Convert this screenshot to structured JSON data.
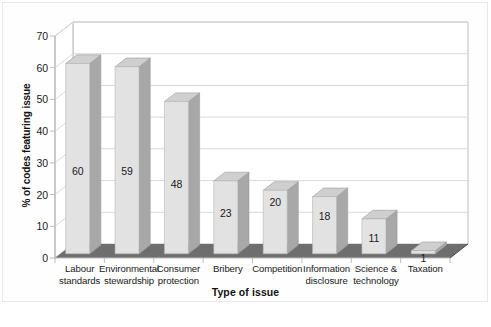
{
  "chart_data": {
    "type": "bar",
    "title": "",
    "subtitle": "",
    "xlabel": "Type of issue",
    "ylabel": "% of codes featuring issue",
    "categories": [
      "Labour standards",
      "Environmental stewardship",
      "Consumer protection",
      "Bribery",
      "Competition",
      "Information disclosure",
      "Science & technology",
      "Taxation"
    ],
    "category_lines": [
      [
        "Labour",
        "standards"
      ],
      [
        "Environmental",
        "stewardship"
      ],
      [
        "Consumer",
        "protection"
      ],
      [
        "Bribery",
        ""
      ],
      [
        "Competition",
        ""
      ],
      [
        "Information",
        "disclosure"
      ],
      [
        "Science &",
        "technology"
      ],
      [
        "Taxation",
        ""
      ]
    ],
    "values": [
      60,
      59,
      48,
      23,
      20,
      18,
      11,
      1
    ],
    "value_labels": [
      "60",
      "59",
      "48",
      "23",
      "20",
      "18",
      "11",
      "1"
    ],
    "ylim": [
      0,
      70
    ],
    "ytick_labels": [
      "0",
      "10",
      "20",
      "30",
      "40",
      "50",
      "60",
      "70"
    ],
    "ytick_values": [
      0,
      10,
      20,
      30,
      40,
      50,
      60,
      70
    ],
    "grid": true,
    "grid_axis": "y",
    "legend": "none",
    "style": "3d-column",
    "colors": {
      "bar_front": "#e2e2e2",
      "bar_top": "#cfcfcf",
      "bar_side": "#a8a8a8",
      "floor": "#6e6e6e",
      "floor_edge": "#4f4f4f",
      "gridline": "#d8d8d8",
      "axis": "#bdbdbd",
      "wall": "#ffffff",
      "text": "#1a1a1a",
      "frame": "#e9e9e9"
    }
  },
  "caption": {
    "sliver_text": ""
  }
}
